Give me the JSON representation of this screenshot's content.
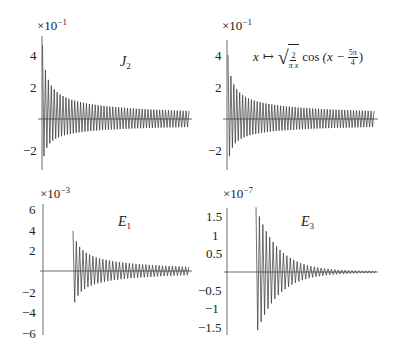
{
  "chart_data": [
    {
      "type": "line",
      "panel": "top-left",
      "title": "J_2",
      "label": "J₂",
      "multiplier": "×10⁻¹",
      "xlabel": "",
      "ylabel": "",
      "yticks": [
        "4",
        "2",
        "−2"
      ],
      "ytick_values": [
        4,
        2,
        -2
      ],
      "ylim": [
        -3,
        5
      ],
      "grid": false,
      "description": "Rapidly oscillating signal with decaying envelope, peak ~4.6 at start, settling to amplitude ~0.5",
      "envelope": {
        "start_max": 4.6,
        "start_min": -2.9,
        "end_amplitude": 0.5
      },
      "n_oscillations": 50
    },
    {
      "type": "line",
      "panel": "top-right",
      "title": "x ↦ sqrt(2/(πx)) cos(x − 5π/4)",
      "multiplier": "×10⁻¹",
      "yticks": [
        "4",
        "2",
        "−2"
      ],
      "ytick_values": [
        4,
        2,
        -2
      ],
      "ylim": [
        -3,
        5
      ],
      "grid": false,
      "description": "Asymptotic approximation of J_2, oscillation with decaying envelope",
      "envelope": {
        "start_max": 4.0,
        "start_min": -2.9,
        "end_amplitude": 0.5
      },
      "n_oscillations": 50
    },
    {
      "type": "line",
      "panel": "bottom-left",
      "title": "E_1",
      "label": "E₁",
      "multiplier": "×10⁻³",
      "yticks": [
        "6",
        "4",
        "2",
        "−2",
        "−4",
        "−6"
      ],
      "ytick_values": [
        6,
        4,
        2,
        -2,
        -4,
        -6
      ],
      "ylim": [
        -6,
        6
      ],
      "grid": false,
      "description": "Error of first-order approximation; starts at x offset, peak ~3.9, decays to ~0.4",
      "envelope": {
        "start_max": 3.9,
        "start_min": -3.6,
        "end_amplitude": 0.4
      },
      "n_oscillations": 35
    },
    {
      "type": "line",
      "panel": "bottom-right",
      "title": "E_3",
      "label": "E₃",
      "multiplier": "×10⁻⁷",
      "yticks": [
        "1.5",
        "1",
        "0.5",
        "−0.5",
        "−1",
        "−1.5"
      ],
      "ytick_values": [
        1.5,
        1,
        0.5,
        -0.5,
        -1,
        -1.5
      ],
      "ylim": [
        -1.7,
        1.7
      ],
      "grid": false,
      "description": "Error of third-order approximation; starts at x offset, peak ~1.75, decays rapidly to ~0.02",
      "envelope": {
        "start_max": 1.75,
        "start_min": -1.7,
        "end_amplitude": 0.02
      },
      "n_oscillations": 35
    }
  ],
  "panels": {
    "tl": {
      "mult_base": "×10",
      "mult_exp": "−1",
      "label_main": "J",
      "label_sub": "2",
      "ticks": [
        "4",
        "2",
        "−2"
      ]
    },
    "tr": {
      "mult_base": "×10",
      "mult_exp": "−1",
      "ticks": [
        "4",
        "2",
        "−2"
      ],
      "formula": {
        "x": "x",
        "maps": "↦",
        "frac_num": "2",
        "frac_den": "π x",
        "cos": "cos",
        "open": "(x −",
        "frac2_num": "5π",
        "frac2_den": "4",
        "close": ")"
      }
    },
    "bl": {
      "mult_base": "×10",
      "mult_exp": "−3",
      "label_main": "E",
      "label_sub": "1",
      "ticks": [
        "6",
        "4",
        "2",
        "−2",
        "−4",
        "−6"
      ]
    },
    "br": {
      "mult_base": "×10",
      "mult_exp": "−7",
      "label_main": "E",
      "label_sub": "3",
      "ticks": [
        "1.5",
        "1",
        "0.5",
        "−0.5",
        "−1",
        "−1.5"
      ]
    }
  }
}
